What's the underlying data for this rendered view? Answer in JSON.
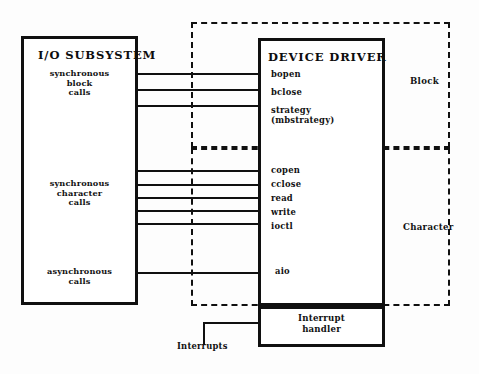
{
  "diagram": {
    "io_subsystem": {
      "title": "I/O SUBSYSTEM",
      "call_groups": [
        {
          "label": "synchronous\nblock\ncalls"
        },
        {
          "label": "synchronous\ncharacter\ncalls"
        },
        {
          "label": "asynchronous\ncalls"
        }
      ]
    },
    "device_driver": {
      "title": "DEVICE DRIVER",
      "block_entries": [
        {
          "label": "bopen"
        },
        {
          "label": "bclose"
        },
        {
          "label": "strategy\n(mbstrategy)"
        }
      ],
      "character_entries": [
        {
          "label": "copen"
        },
        {
          "label": "cclose"
        },
        {
          "label": "read"
        },
        {
          "label": "write"
        },
        {
          "label": "ioctl"
        }
      ],
      "async_entries": [
        {
          "label": "aio"
        }
      ]
    },
    "regions": [
      {
        "label": "Block"
      },
      {
        "label": "Character"
      }
    ],
    "interrupt": {
      "title": "Interrupt\nhandler",
      "caption": "Interrupts"
    },
    "colors": {
      "ink": "#101010",
      "paper": "#fdfdfd"
    }
  }
}
